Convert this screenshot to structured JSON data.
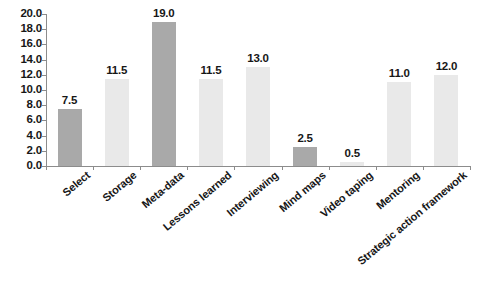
{
  "chart_data": {
    "type": "bar",
    "title": "",
    "subtitle": "",
    "xlabel": "",
    "ylabel": "",
    "ylim": [
      0,
      20
    ],
    "ytick_step": 2,
    "grid": false,
    "legend": "none",
    "value_labels": true,
    "categories": [
      "Select",
      "Storage",
      "Meta-data",
      "Lessons learned",
      "Interviewing",
      "Mind maps",
      "Video taping",
      "Mentoring",
      "Strategic action framework"
    ],
    "values": [
      7.5,
      11.5,
      19.0,
      11.5,
      13.0,
      2.5,
      0.5,
      11.0,
      12.0
    ],
    "value_label_texts": [
      "7.5",
      "11.5",
      "19.0",
      "11.5",
      "13.0",
      "2.5",
      "0.5",
      "11.0",
      "12.0"
    ],
    "bar_shades": [
      "dark",
      "light",
      "dark",
      "light",
      "light",
      "dark",
      "light",
      "light",
      "light"
    ],
    "ytick_labels": [
      "20.0",
      "18.0",
      "16.0",
      "14.0",
      "12.0",
      "10.0",
      "8.0",
      "6.0",
      "4.0",
      "2.0",
      "0.0"
    ],
    "ytick_values": [
      20,
      18,
      16,
      14,
      12,
      10,
      8,
      6,
      4,
      2,
      0
    ],
    "colors": {
      "bar_dark": "#a9a9a9",
      "bar_light": "#e9e9e9",
      "axis": "#8c8c8c",
      "text": "#171717",
      "background": "#ffffff"
    }
  }
}
